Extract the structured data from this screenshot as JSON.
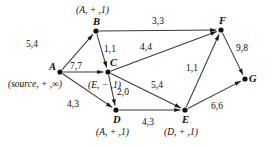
{
  "figure": {
    "type": "flow-network-diagram"
  },
  "nodes": [
    {
      "id": "A",
      "name": "A",
      "x": 60,
      "y": 72,
      "label_dx": -11,
      "label_dy": -10
    },
    {
      "id": "B",
      "name": "B",
      "x": 96,
      "y": 31,
      "label_dx": -3,
      "label_dy": -14
    },
    {
      "id": "C",
      "name": "C",
      "x": 108,
      "y": 72,
      "label_dx": 2,
      "label_dy": -14
    },
    {
      "id": "D",
      "name": "D",
      "x": 116,
      "y": 110,
      "label_dx": -3,
      "label_dy": 5
    },
    {
      "id": "E",
      "name": "E",
      "x": 185,
      "y": 110,
      "label_dx": -3,
      "label_dy": 5
    },
    {
      "id": "F",
      "name": "F",
      "x": 221,
      "y": 30,
      "label_dx": -2,
      "label_dy": -14
    },
    {
      "id": "G",
      "name": "G",
      "x": 245,
      "y": 79,
      "label_dx": 4,
      "label_dy": -5
    }
  ],
  "vertex_labels": [
    {
      "node": "A",
      "text": "(source, + ,∞)",
      "x": 8,
      "y": 80
    },
    {
      "node": "B",
      "text": "(A, + ,1)",
      "x": 76,
      "y": 6
    },
    {
      "node": "C",
      "text": "(E, − ,1)",
      "x": 88,
      "y": 81
    },
    {
      "node": "D",
      "text": "(A, + ,1)",
      "x": 96,
      "y": 128
    },
    {
      "node": "E",
      "text": "(D, + ,1)",
      "x": 164,
      "y": 128
    }
  ],
  "edges": [
    {
      "from": "A",
      "to": "B",
      "capacity": 5,
      "flow": 4,
      "label": "5,4",
      "lx": 26,
      "ly": 40
    },
    {
      "from": "A",
      "to": "C",
      "capacity": 7,
      "flow": 7,
      "label": "7,7",
      "lx": 70,
      "ly": 62
    },
    {
      "from": "A",
      "to": "D",
      "capacity": 4,
      "flow": 3,
      "label": "4,3",
      "lx": 67,
      "ly": 100
    },
    {
      "from": "B",
      "to": "C",
      "capacity": 1,
      "flow": 1,
      "label": "1,1",
      "lx": 104,
      "ly": 45
    },
    {
      "from": "B",
      "to": "F",
      "capacity": 3,
      "flow": 3,
      "label": "3,3",
      "lx": 152,
      "ly": 17
    },
    {
      "from": "C",
      "to": "F",
      "capacity": 4,
      "flow": 4,
      "label": "4,4",
      "lx": 140,
      "ly": 43
    },
    {
      "from": "C",
      "to": "D",
      "capacity": 2,
      "flow": 0,
      "label": "2,0",
      "lx": 117,
      "ly": 88
    },
    {
      "from": "C",
      "to": "E",
      "capacity": 5,
      "flow": 4,
      "label": "5,4",
      "lx": 151,
      "ly": 81
    },
    {
      "from": "D",
      "to": "E",
      "capacity": 4,
      "flow": 3,
      "label": "4,3",
      "lx": 142,
      "ly": 118
    },
    {
      "from": "E",
      "to": "F",
      "capacity": 1,
      "flow": 1,
      "label": "1,1",
      "lx": 186,
      "ly": 64
    },
    {
      "from": "E",
      "to": "G",
      "capacity": 6,
      "flow": 6,
      "label": "6,6",
      "lx": 211,
      "ly": 102
    },
    {
      "from": "F",
      "to": "G",
      "capacity": 9,
      "flow": 8,
      "label": "9,8",
      "lx": 236,
      "ly": 44
    }
  ]
}
